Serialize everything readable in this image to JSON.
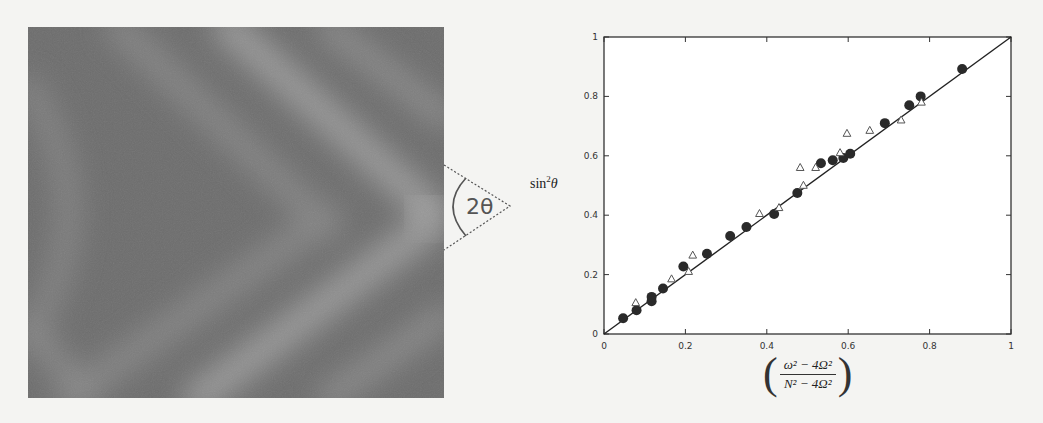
{
  "photo": {
    "annotation_label": "2θ",
    "colors": {
      "dark": "#666666",
      "light": "#9a9a9a"
    }
  },
  "chart_data": {
    "type": "scatter",
    "title": "",
    "xlabel": "((ω² − 4Ω²) / (N² − 4Ω²))",
    "xlabel_num": "ω² − 4Ω²",
    "xlabel_den": "N² − 4Ω²",
    "ylabel": "sin²θ",
    "ylabel_base": "sin",
    "ylabel_sup": "2",
    "ylabel_var": "θ",
    "xlim": [
      0,
      1
    ],
    "ylim": [
      0,
      1
    ],
    "xticks": [
      "0",
      "0.2",
      "0.4",
      "0.6",
      "0.8",
      "1"
    ],
    "yticks": [
      "0",
      "0.2",
      "0.4",
      "0.6",
      "0.8",
      "1"
    ],
    "grid": false,
    "legend": "none",
    "reference_line": {
      "label": "y = x",
      "from": [
        0,
        0
      ],
      "to": [
        1,
        1
      ]
    },
    "series": [
      {
        "name": "filled circles",
        "marker": "circle-filled",
        "points": [
          [
            0.047,
            0.053
          ],
          [
            0.08,
            0.08
          ],
          [
            0.117,
            0.11
          ],
          [
            0.117,
            0.125
          ],
          [
            0.145,
            0.153
          ],
          [
            0.195,
            0.227
          ],
          [
            0.253,
            0.27
          ],
          [
            0.31,
            0.33
          ],
          [
            0.35,
            0.36
          ],
          [
            0.418,
            0.404
          ],
          [
            0.475,
            0.475
          ],
          [
            0.533,
            0.575
          ],
          [
            0.562,
            0.585
          ],
          [
            0.588,
            0.593
          ],
          [
            0.605,
            0.607
          ],
          [
            0.69,
            0.71
          ],
          [
            0.75,
            0.77
          ],
          [
            0.778,
            0.8
          ],
          [
            0.88,
            0.892
          ]
        ]
      },
      {
        "name": "open triangles",
        "marker": "triangle-open",
        "points": [
          [
            0.078,
            0.105
          ],
          [
            0.166,
            0.185
          ],
          [
            0.208,
            0.21
          ],
          [
            0.218,
            0.265
          ],
          [
            0.382,
            0.405
          ],
          [
            0.43,
            0.425
          ],
          [
            0.482,
            0.56
          ],
          [
            0.49,
            0.5
          ],
          [
            0.52,
            0.56
          ],
          [
            0.58,
            0.61
          ],
          [
            0.597,
            0.675
          ],
          [
            0.653,
            0.685
          ],
          [
            0.73,
            0.72
          ],
          [
            0.78,
            0.78
          ]
        ]
      }
    ]
  }
}
